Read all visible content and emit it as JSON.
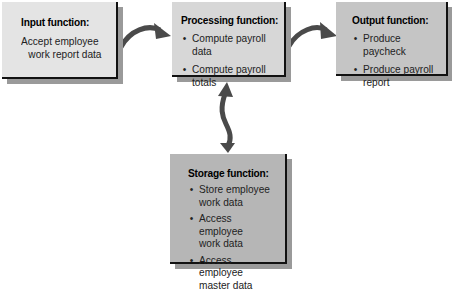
{
  "diagram": {
    "input": {
      "title": "Input function:",
      "lines": [
        "Accept employee",
        "work report data"
      ]
    },
    "processing": {
      "title": "Processing function:",
      "items": [
        "Compute payroll data",
        "Compute payroll totals"
      ]
    },
    "output": {
      "title": "Output function:",
      "items": [
        "Produce paycheck",
        "Produce payroll\nreport"
      ]
    },
    "storage": {
      "title": "Storage function:",
      "items": [
        "Store employee\nwork data",
        "Access employee\nwork data",
        "Access employee\nmaster data"
      ]
    },
    "bullet": "•",
    "colors": {
      "input_fill": "#e4e4e4",
      "processing_fill": "#d7d7d7",
      "output_fill": "#c5c5c5",
      "storage_fill": "#b6b6b6",
      "arrow": "#4a4a4a",
      "shadow": "#9a9a9a"
    },
    "connections": [
      {
        "from": "input",
        "to": "processing",
        "type": "curved-arrow"
      },
      {
        "from": "processing",
        "to": "output",
        "type": "curved-arrow"
      },
      {
        "from": "processing",
        "to": "storage",
        "type": "bidirectional-arrow"
      }
    ]
  }
}
